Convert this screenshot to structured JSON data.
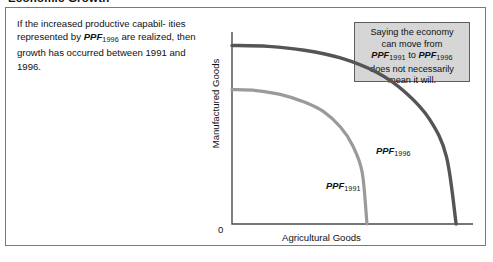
{
  "figure": {
    "title": "Economic Growth"
  },
  "explanation": {
    "line1_pre": "If the increased productive capabil-",
    "line2_pre": "ities represented by ",
    "ppf_term": "PPF",
    "ppf_year_1996": "1996",
    "ppf_year_1991": "1991",
    "line2_post": " are",
    "line3": "realized, then growth has occurred",
    "line4": "between 1991 and 1996."
  },
  "callout": {
    "line1": "Saying the economy",
    "line2": "can move from",
    "line3_ppf": "PPF",
    "line3_sub_from": "1991",
    "line3_to": " to ",
    "line3_ppf2": "PPF",
    "line3_sub_to": "1996",
    "line4": "does not necessarily",
    "line5": "mean it will.",
    "bg_color": "#d6d6d6",
    "border_color": "#5e5e5e"
  },
  "chart_data": {
    "type": "line",
    "title": "Economic Growth",
    "xlabel": "Agricultural Goods",
    "ylabel": "Manufactured Goods",
    "origin_label": "0",
    "grid": false,
    "legend": "inline-annotations",
    "axis_color": "#4a4a4a",
    "xlim": [
      0,
      1
    ],
    "ylim": [
      0,
      1
    ],
    "series": [
      {
        "name": "PPF1991",
        "label_text": "PPF",
        "label_sub": "1991",
        "color": "#9a9a9a",
        "line_width": 3.2,
        "description": "Inner production possibilities frontier, concave to origin",
        "y_intercept": 0.7,
        "x_intercept": 0.56,
        "points": [
          [
            0.0,
            0.7
          ],
          [
            0.1,
            0.695
          ],
          [
            0.2,
            0.675
          ],
          [
            0.3,
            0.635
          ],
          [
            0.38,
            0.585
          ],
          [
            0.45,
            0.505
          ],
          [
            0.5,
            0.41
          ],
          [
            0.54,
            0.27
          ],
          [
            0.56,
            0.0
          ]
        ]
      },
      {
        "name": "PPF1996",
        "label_text": "PPF",
        "label_sub": "1996",
        "color": "#555555",
        "line_width": 3.4,
        "description": "Outer production possibilities frontier after growth",
        "y_intercept": 0.93,
        "x_intercept": 0.93,
        "points": [
          [
            0.0,
            0.93
          ],
          [
            0.15,
            0.925
          ],
          [
            0.3,
            0.905
          ],
          [
            0.45,
            0.865
          ],
          [
            0.6,
            0.79
          ],
          [
            0.72,
            0.685
          ],
          [
            0.82,
            0.545
          ],
          [
            0.89,
            0.35
          ],
          [
            0.93,
            0.0
          ]
        ]
      }
    ]
  }
}
